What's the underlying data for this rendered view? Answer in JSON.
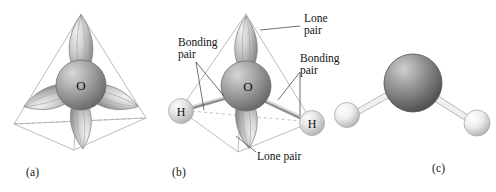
{
  "figure": {
    "background_color": "#ffffff",
    "panels": [
      {
        "id": "a",
        "caption": "(a)",
        "description": "Tetrahedral arrangement of four sp3 hybrid orbitals on oxygen",
        "center_atom_label": "O",
        "lobe_count": 4,
        "wireframe": "tetrahedron"
      },
      {
        "id": "b",
        "caption": "(b)",
        "description": "Water molecule showing two bonding pairs and two lone pairs",
        "center_atom_label": "O",
        "hydrogen_labels": [
          "H",
          "H"
        ],
        "lobe_count": 4,
        "wireframe": "tetrahedron"
      },
      {
        "id": "c",
        "caption": "(c)",
        "description": "Ball-and-stick model of the bent water molecule",
        "atoms": [
          "O",
          "H",
          "H"
        ]
      }
    ]
  },
  "labels": {
    "bonding_pair_left": {
      "line1": "Bonding",
      "line2": "pair"
    },
    "lone_pair_top": {
      "line1": "Lone",
      "line2": "pair"
    },
    "bonding_pair_right": {
      "line1": "Bonding",
      "line2": "pair"
    },
    "lone_pair_bottom": {
      "line1": "Lone pair"
    }
  },
  "atom_labels": {
    "oxygen_a": "O",
    "oxygen_b": "O",
    "hydrogen_left": "H",
    "hydrogen_right": "H"
  },
  "colors": {
    "background": "#ffffff",
    "lobe_light": "#e8e8e8",
    "lobe_mid": "#b4b4b4",
    "lobe_dark": "#8a8a8a",
    "sphere_oxygen_light": "#c8c8c8",
    "sphere_oxygen_dark": "#6e6e6e",
    "sphere_oxygen_c_light": "#bdbdbd",
    "sphere_oxygen_c_dark": "#585858",
    "sphere_hydrogen_light": "#f2f2f2",
    "sphere_hydrogen_dark": "#b8b8b8",
    "wireframe": "#9a9a9a",
    "leader_line": "#4a4a4a",
    "text": "#121212"
  }
}
